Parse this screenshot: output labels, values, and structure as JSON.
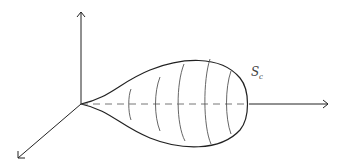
{
  "diagram": {
    "title": "",
    "surface_label": "S",
    "surface_label_subscript": "c",
    "colors": {
      "stroke": "#222222",
      "dashed": "#777777",
      "meridian": "#555555",
      "background": "#ffffff"
    }
  }
}
